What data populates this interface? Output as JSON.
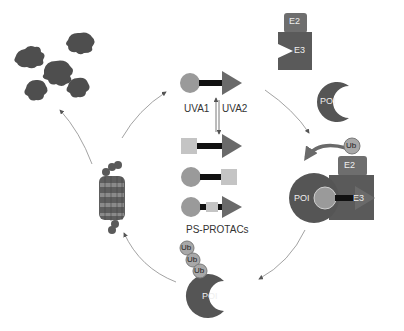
{
  "figure": {
    "type": "diagram",
    "colors": {
      "dark_protein": "#555555",
      "e3_ligase": "#5a5a5a",
      "e2_enzyme": "#6e6e6e",
      "ligand_circle": "#9a9a9a",
      "ligand_triangle": "#6a6a6a",
      "switch_square": "#c4c4c4",
      "linker": "#111111",
      "ub": "#a8a8a8",
      "arrow": "#777777",
      "background": "#ffffff"
    }
  },
  "center": {
    "uva1_label": "UVA1",
    "uva2_label": "UVA2",
    "protac_label": "PS-PROTACs"
  },
  "top_right": {
    "e2_label": "E2",
    "e3_label": "E3",
    "poi_label": "POI"
  },
  "right_complex": {
    "ub_label": "Ub",
    "e2_label": "E2",
    "e3_label": "E3",
    "poi_label": "POI"
  },
  "bottom": {
    "ub_labels": [
      "Ub",
      "Ub",
      "Ub"
    ],
    "poi_label": "POI"
  },
  "left": {
    "proteasome_name": "proteasome",
    "fragments_name": "degraded peptide fragments"
  }
}
